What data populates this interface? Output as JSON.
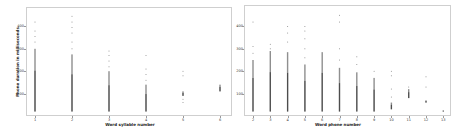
{
  "chart_data": [
    {
      "type": "scatter",
      "title": "",
      "xlabel": "Word syllable number",
      "ylabel": "Phone duration in milliseconds",
      "x_ticks": [
        "1",
        "2",
        "3",
        "4",
        "5",
        "6"
      ],
      "y_ticks": [
        100,
        200,
        300,
        400
      ],
      "ylim": [
        0,
        450
      ],
      "grid": false,
      "legend": null,
      "columns": [
        {
          "x": 1,
          "dense_min": 20,
          "dense_max": 300,
          "outliers": [
            330,
            355,
            380,
            420
          ]
        },
        {
          "x": 2,
          "dense_min": 20,
          "dense_max": 275,
          "outliers": [
            300,
            330,
            370,
            395,
            420,
            445
          ]
        },
        {
          "x": 3,
          "dense_min": 20,
          "dense_max": 200,
          "outliers": [
            220,
            245,
            270,
            290
          ]
        },
        {
          "x": 4,
          "dense_min": 20,
          "dense_max": 140,
          "outliers": [
            160,
            185,
            210,
            270
          ]
        },
        {
          "x": 5,
          "dense_min": 90,
          "dense_max": 110,
          "outliers": [
            60,
            75,
            180,
            200
          ]
        },
        {
          "x": 6,
          "dense_min": 110,
          "dense_max": 140,
          "outliers": []
        }
      ]
    },
    {
      "type": "scatter",
      "title": "",
      "xlabel": "Word phone number",
      "ylabel": "",
      "x_ticks": [
        "2",
        "3",
        "4",
        "5",
        "6",
        "7",
        "8",
        "9",
        "10",
        "11",
        "12",
        "13"
      ],
      "y_ticks": [
        100,
        200,
        300,
        400
      ],
      "ylim": [
        0,
        450
      ],
      "grid": false,
      "legend": null,
      "columns": [
        {
          "x": 2,
          "dense_min": 20,
          "dense_max": 250,
          "outliers": [
            280,
            310,
            420
          ]
        },
        {
          "x": 3,
          "dense_min": 20,
          "dense_max": 290,
          "outliers": [
            300,
            320
          ]
        },
        {
          "x": 4,
          "dense_min": 20,
          "dense_max": 285,
          "outliers": [
            330,
            370,
            400
          ]
        },
        {
          "x": 5,
          "dense_min": 20,
          "dense_max": 230,
          "outliers": [
            260,
            300,
            345,
            380,
            400
          ]
        },
        {
          "x": 6,
          "dense_min": 20,
          "dense_max": 285,
          "outliers": []
        },
        {
          "x": 7,
          "dense_min": 20,
          "dense_max": 215,
          "outliers": [
            250,
            300,
            420,
            450
          ]
        },
        {
          "x": 8,
          "dense_min": 20,
          "dense_max": 195,
          "outliers": [
            230,
            265
          ]
        },
        {
          "x": 9,
          "dense_min": 20,
          "dense_max": 170,
          "outliers": [
            200
          ]
        },
        {
          "x": 10,
          "dense_min": 30,
          "dense_max": 60,
          "outliers": [
            85,
            120,
            180,
            200
          ]
        },
        {
          "x": 11,
          "dense_min": 80,
          "dense_max": 120,
          "outliers": [
            130
          ]
        },
        {
          "x": 12,
          "dense_min": 60,
          "dense_max": 70,
          "outliers": [
            130,
            175
          ]
        },
        {
          "x": 13,
          "dense_min": 20,
          "dense_max": 25,
          "outliers": []
        }
      ]
    }
  ],
  "panels": [
    {
      "xlabel": "Word syllable number",
      "ylabel": "Phone duration in milliseconds",
      "x_ticks": [
        "1",
        "2",
        "3",
        "4",
        "5",
        "6"
      ],
      "y_ticks": [
        "100",
        "200",
        "300",
        "400"
      ]
    },
    {
      "xlabel": "Word phone number",
      "ylabel": "",
      "x_ticks": [
        "2",
        "3",
        "4",
        "5",
        "6",
        "7",
        "8",
        "9",
        "10",
        "11",
        "12",
        "13"
      ],
      "y_ticks": [
        "100",
        "200",
        "300",
        "400"
      ]
    }
  ],
  "colors": {
    "points": "#333333",
    "axis": "#999999",
    "frame": "#cfcfcf"
  }
}
